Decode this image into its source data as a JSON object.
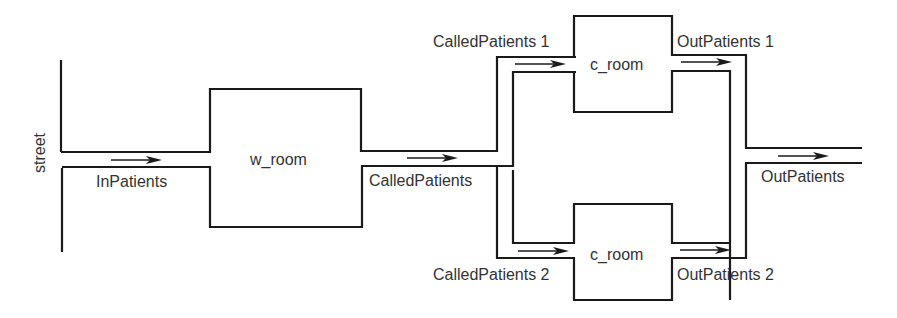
{
  "diagram": {
    "street_label": "street",
    "rooms": {
      "waiting_room": "w_room",
      "consult_room_1": "c_room",
      "consult_room_2": "c_room"
    },
    "channels": {
      "in_patients": "InPatients",
      "called_patients": "CalledPatients",
      "called_patients_1": "CalledPatients 1",
      "called_patients_2": "CalledPatients 2",
      "out_patients_1": "OutPatients 1",
      "out_patients_2": "OutPatients 2",
      "out_patients": "OutPatients"
    },
    "colors": {
      "line": "#1a1a1a",
      "text": "#333333"
    }
  }
}
